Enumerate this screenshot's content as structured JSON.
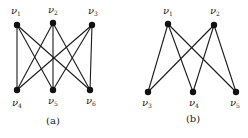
{
  "diagram": {
    "graphs": [
      {
        "id": "a",
        "caption": "(a)",
        "caption_pos": [
          53,
          124
        ],
        "nodes": [
          {
            "id": "v1",
            "label": "ν",
            "sub": "1",
            "x": 17,
            "y": 25,
            "lx": 11,
            "ly": 14
          },
          {
            "id": "v2",
            "label": "ν",
            "sub": "2",
            "x": 53,
            "y": 23,
            "lx": 48,
            "ly": 13
          },
          {
            "id": "v3",
            "label": "ν",
            "sub": "3",
            "x": 92,
            "y": 25,
            "lx": 88,
            "ly": 14
          },
          {
            "id": "v4",
            "label": "ν",
            "sub": "4",
            "x": 17,
            "y": 90,
            "lx": 12,
            "ly": 106
          },
          {
            "id": "v5",
            "label": "ν",
            "sub": "5",
            "x": 53,
            "y": 90,
            "lx": 48,
            "ly": 104
          },
          {
            "id": "v6",
            "label": "ν",
            "sub": "6",
            "x": 90,
            "y": 90,
            "lx": 86,
            "ly": 104
          }
        ],
        "edges": [
          [
            "v1",
            "v4"
          ],
          [
            "v1",
            "v5"
          ],
          [
            "v1",
            "v6"
          ],
          [
            "v2",
            "v4"
          ],
          [
            "v2",
            "v5"
          ],
          [
            "v2",
            "v6"
          ],
          [
            "v3",
            "v4"
          ],
          [
            "v3",
            "v5"
          ],
          [
            "v3",
            "v6"
          ]
        ]
      },
      {
        "id": "b",
        "caption": "(b)",
        "caption_pos": [
          193,
          122
        ],
        "nodes": [
          {
            "id": "v1",
            "label": "ν",
            "sub": "1",
            "x": 168,
            "y": 24,
            "lx": 163,
            "ly": 14
          },
          {
            "id": "v2",
            "label": "ν",
            "sub": "2",
            "x": 214,
            "y": 25,
            "lx": 210,
            "ly": 14
          },
          {
            "id": "v3",
            "label": "ν",
            "sub": "3",
            "x": 148,
            "y": 92,
            "lx": 142,
            "ly": 106
          },
          {
            "id": "v4",
            "label": "ν",
            "sub": "4",
            "x": 193,
            "y": 92,
            "lx": 189,
            "ly": 106
          },
          {
            "id": "v5",
            "label": "ν",
            "sub": "5",
            "x": 236,
            "y": 92,
            "lx": 230,
            "ly": 106
          }
        ],
        "edges": [
          [
            "v1",
            "v3"
          ],
          [
            "v1",
            "v4"
          ],
          [
            "v1",
            "v5"
          ],
          [
            "v2",
            "v3"
          ],
          [
            "v2",
            "v4"
          ],
          [
            "v2",
            "v5"
          ]
        ]
      }
    ]
  }
}
